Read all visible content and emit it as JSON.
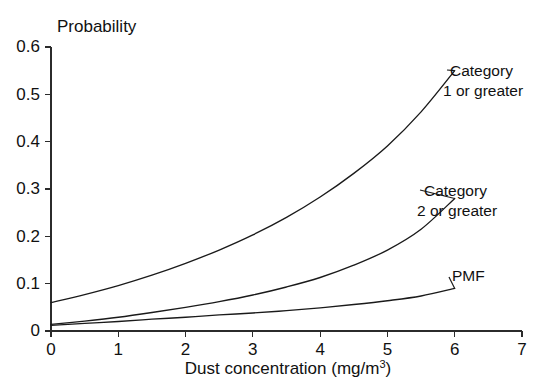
{
  "chart_data": {
    "type": "line",
    "title": "",
    "ylabel": "Probability",
    "xlabel": "Dust concentration (mg/m",
    "xlabel_sup": "3",
    "xlabel_tail": ")",
    "xlim": [
      0,
      7
    ],
    "ylim": [
      0,
      0.6
    ],
    "grid": false,
    "legend_position": "inline-annotations",
    "xticks": [
      "0",
      "1",
      "2",
      "3",
      "4",
      "5",
      "6",
      "7"
    ],
    "xtick_values": [
      0,
      1,
      2,
      3,
      4,
      5,
      6,
      7
    ],
    "yticks": [
      "0",
      "0.1",
      "0.2",
      "0.3",
      "0.4",
      "0.5",
      "0.6"
    ],
    "ytick_values": [
      0,
      0.1,
      0.2,
      0.3,
      0.4,
      0.5,
      0.6
    ],
    "x": [
      0,
      0.5,
      1,
      1.5,
      2,
      2.5,
      3,
      3.5,
      4,
      4.5,
      5,
      5.5,
      6
    ],
    "series": [
      {
        "name": "Category 1 or greater",
        "label_line1": "Category",
        "label_line2": "1 or greater",
        "color": "#1a1a1a",
        "values": [
          0.06,
          0.077,
          0.096,
          0.118,
          0.143,
          0.171,
          0.203,
          0.24,
          0.283,
          0.333,
          0.391,
          0.463,
          0.55
        ]
      },
      {
        "name": "Category 2 or greater",
        "label_line1": "Category",
        "label_line2": "2 or greater",
        "color": "#1a1a1a",
        "values": [
          0.014,
          0.021,
          0.029,
          0.039,
          0.05,
          0.062,
          0.076,
          0.093,
          0.113,
          0.139,
          0.171,
          0.215,
          0.28
        ]
      },
      {
        "name": "PMF",
        "label_line1": "PMF",
        "label_line2": "",
        "color": "#1a1a1a",
        "values": [
          0.012,
          0.016,
          0.02,
          0.025,
          0.029,
          0.034,
          0.038,
          0.043,
          0.049,
          0.056,
          0.064,
          0.074,
          0.09
        ]
      }
    ],
    "annotations": [
      {
        "text": "Category 1 or greater",
        "x_px": 450,
        "y_px": 76
      },
      {
        "text": "Category 2 or greater",
        "x_px": 424,
        "y_px": 196
      },
      {
        "text": "PMF",
        "x_px": 452,
        "y_px": 281
      }
    ]
  }
}
